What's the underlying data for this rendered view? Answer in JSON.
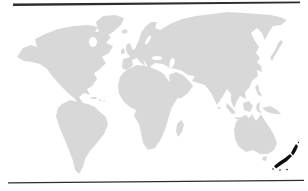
{
  "window": {
    "width": 308,
    "height": 191,
    "background": "#ffffff"
  },
  "decorations": {
    "rule_color": "#2d2d2d",
    "top_rule": "horizontal black rule, slightly slanted, full width",
    "bottom_rule": "horizontal black rule, slightly slanted, full width"
  },
  "map": {
    "type": "world-silhouette",
    "projection": "flat world outline, scanned grayscale",
    "ocean_color": "#ffffff",
    "land_color": "#d8d8d8",
    "highlight_color": "#101010",
    "highlighted_region": "New Zealand",
    "regions": [
      {
        "id": "north-america",
        "name": "North America",
        "role": "land"
      },
      {
        "id": "greenland",
        "name": "Greenland",
        "role": "land"
      },
      {
        "id": "iceland",
        "name": "Iceland",
        "role": "land"
      },
      {
        "id": "great-britain",
        "name": "Great Britain",
        "role": "land"
      },
      {
        "id": "ireland",
        "name": "Ireland",
        "role": "land"
      },
      {
        "id": "cuba",
        "name": "Cuba",
        "role": "land"
      },
      {
        "id": "caribbean-islands",
        "name": "Caribbean Islands",
        "role": "land"
      },
      {
        "id": "south-america",
        "name": "South America",
        "role": "land"
      },
      {
        "id": "eurasia",
        "name": "Eurasia",
        "role": "land"
      },
      {
        "id": "arabian-peninsula",
        "name": "Arabian Peninsula",
        "role": "land"
      },
      {
        "id": "africa",
        "name": "Africa",
        "role": "land"
      },
      {
        "id": "madagascar",
        "name": "Madagascar",
        "role": "land"
      },
      {
        "id": "sri-lanka",
        "name": "Sri Lanka",
        "role": "land"
      },
      {
        "id": "japan",
        "name": "Japan",
        "role": "land"
      },
      {
        "id": "philippines",
        "name": "Philippines",
        "role": "land"
      },
      {
        "id": "sumatra",
        "name": "Sumatra",
        "role": "land"
      },
      {
        "id": "java",
        "name": "Java",
        "role": "land"
      },
      {
        "id": "borneo",
        "name": "Borneo",
        "role": "land"
      },
      {
        "id": "sulawesi",
        "name": "Sulawesi",
        "role": "land"
      },
      {
        "id": "new-guinea",
        "name": "New Guinea",
        "role": "land"
      },
      {
        "id": "australia",
        "name": "Australia",
        "role": "land"
      },
      {
        "id": "tasmania",
        "name": "Tasmania",
        "role": "land"
      },
      {
        "id": "new-zealand",
        "name": "New Zealand",
        "role": "highlight"
      }
    ]
  }
}
